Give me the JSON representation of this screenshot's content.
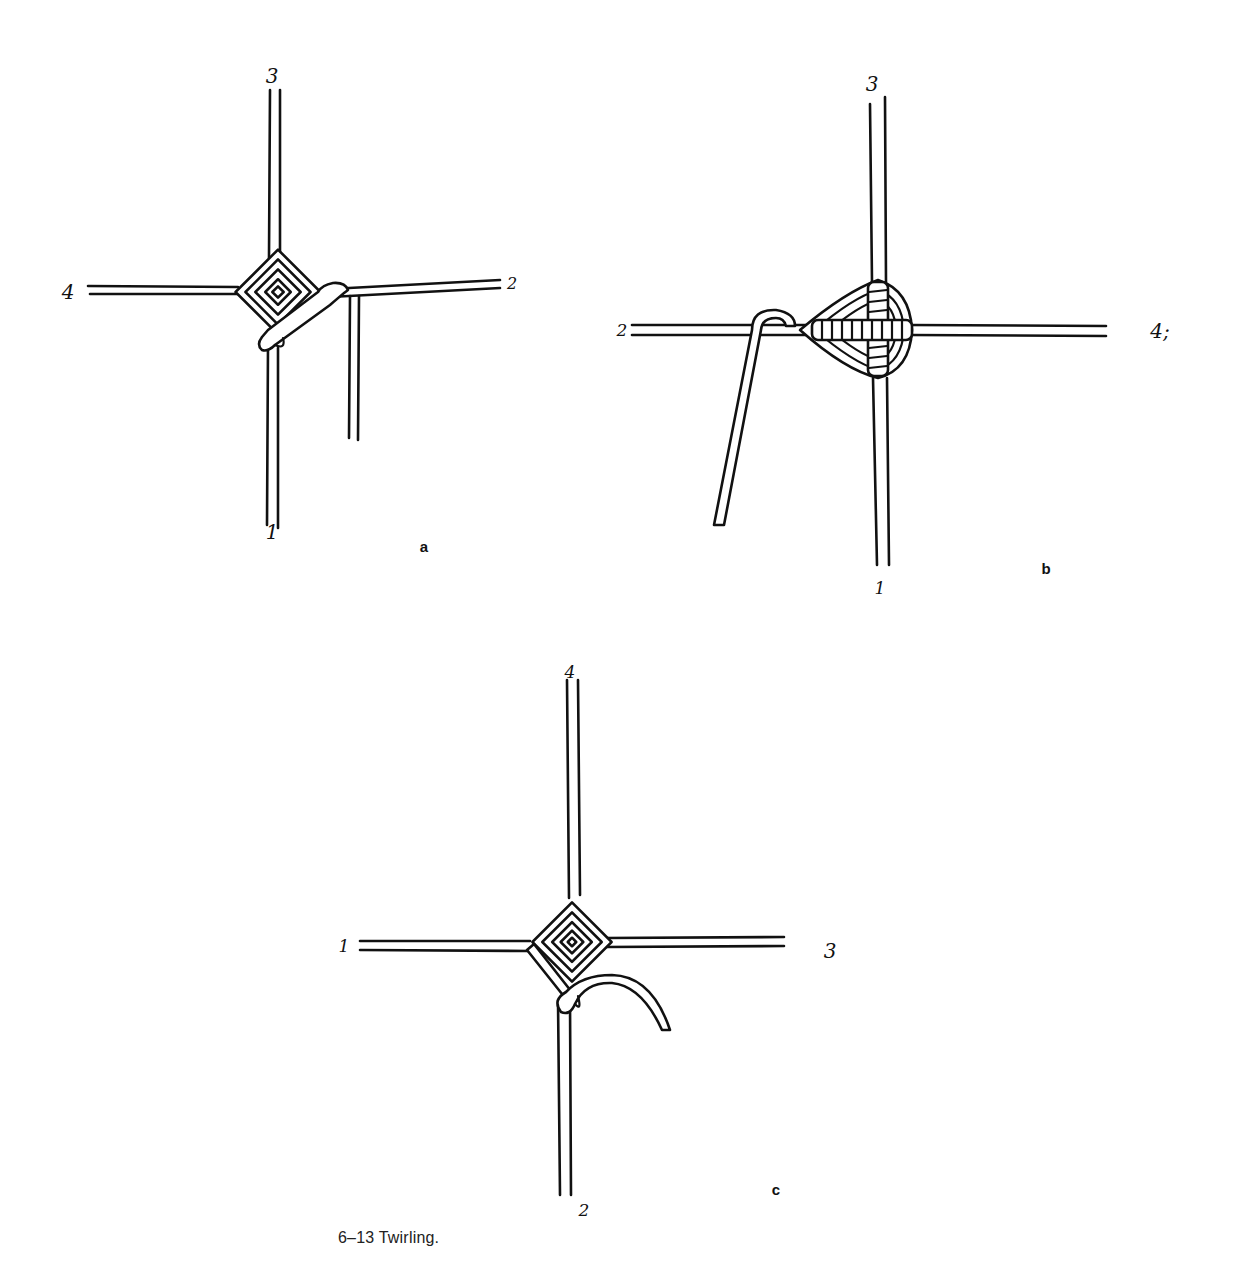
{
  "figure": {
    "caption": "6–13 Twirling.",
    "panels": [
      {
        "id": "a",
        "letter": "a",
        "stick_labels": {
          "top": "3",
          "left": "4",
          "right": "2",
          "bottom": "1"
        }
      },
      {
        "id": "b",
        "letter": "b",
        "stick_labels": {
          "top": "3",
          "left": "2",
          "right": "4;",
          "bottom": "1"
        }
      },
      {
        "id": "c",
        "letter": "c",
        "stick_labels": {
          "top": "4",
          "left": "1",
          "right": "3",
          "bottom": "2"
        }
      }
    ]
  },
  "colors": {
    "ink": "#111111",
    "paper": "#ffffff"
  }
}
